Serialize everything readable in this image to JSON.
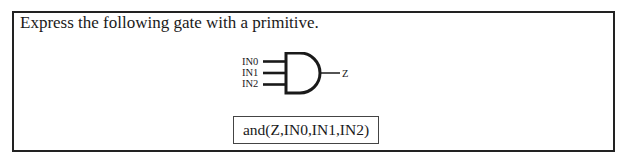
{
  "question": {
    "prompt": "Express the following gate with a primitive."
  },
  "gate": {
    "type": "AND",
    "inputs": [
      "IN0",
      "IN1",
      "IN2"
    ],
    "output": "Z"
  },
  "answer": {
    "text": "and(Z,IN0,IN1,IN2)"
  }
}
